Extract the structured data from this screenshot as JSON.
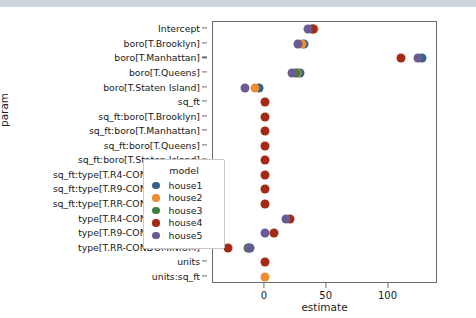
{
  "chart_data": {
    "type": "scatter",
    "title": "",
    "xlabel": "estimate",
    "ylabel": "param",
    "xlim": [
      -42,
      140
    ],
    "xticks": [
      0,
      50,
      100
    ],
    "xticklabels": [
      "0",
      "50",
      "100"
    ],
    "grid": false,
    "legend": {
      "title": "model",
      "position": "lower right",
      "entries": [
        {
          "name": "house1",
          "color": "#36618e"
        },
        {
          "name": "house2",
          "color": "#ef8c32"
        },
        {
          "name": "house3",
          "color": "#3f7f3f"
        },
        {
          "name": "house4",
          "color": "#a52a16"
        },
        {
          "name": "house5",
          "color": "#6b5b95"
        }
      ]
    },
    "categories": [
      "Intercept",
      "boro[T.Brooklyn]",
      "boro[T.Manhattan]",
      "boro[T.Queens]",
      "boro[T.Staten Island]",
      "sq_ft",
      "sq_ft:boro[T.Brooklyn]",
      "sq_ft:boro[T.Manhattan]",
      "sq_ft:boro[T.Queens]",
      "sq_ft:boro[T.Staten Island]",
      "sq_ft:type[T.R4-CONDOMINIUM]",
      "sq_ft:type[T.R9-CONDOMINIUM]",
      "sq_ft:type[T.RR-CONDOMINIUM]",
      "type[T.R4-CONDOMINIUM]",
      "type[T.R9-CONDOMINIUM]",
      "type[T.RR-CONDOMINIUM]",
      "units",
      "units:sq_ft"
    ],
    "series": [
      {
        "name": "house1",
        "color": "#36618e",
        "values": [
          38,
          32,
          127,
          28,
          -4.5,
          null,
          null,
          null,
          null,
          null,
          null,
          null,
          null,
          null,
          null,
          -12,
          null,
          null
        ]
      },
      {
        "name": "house2",
        "color": "#ef8c32",
        "values": [
          40,
          30,
          null,
          26,
          -8,
          null,
          null,
          null,
          null,
          null,
          null,
          null,
          null,
          null,
          null,
          null,
          null,
          0
        ]
      },
      {
        "name": "house3",
        "color": "#3f7f3f",
        "values": [
          null,
          null,
          null,
          25,
          null,
          null,
          null,
          null,
          null,
          null,
          null,
          null,
          null,
          null,
          null,
          -14,
          null,
          null
        ]
      },
      {
        "name": "house4",
        "color": "#a52a16",
        "values": [
          39,
          null,
          110,
          null,
          null,
          0,
          0,
          0,
          0,
          0,
          0,
          0,
          0,
          20,
          7.5,
          -30,
          0,
          null
        ]
      },
      {
        "name": "house5",
        "color": "#6b5b95",
        "values": [
          35,
          27,
          124,
          22,
          -16,
          null,
          null,
          null,
          null,
          null,
          null,
          null,
          null,
          17,
          0,
          -13,
          null,
          null
        ]
      }
    ]
  }
}
